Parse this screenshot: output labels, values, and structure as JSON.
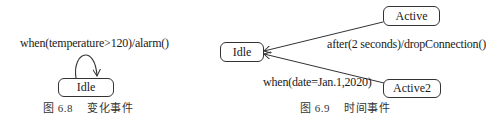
{
  "figure_left": {
    "transition_label": "when(temperature>120)/alarm()",
    "state": {
      "name": "Idle"
    },
    "caption": {
      "number": "图 6.8",
      "title": "变化事件"
    }
  },
  "figure_right": {
    "states": {
      "idle": "Idle",
      "active": "Active",
      "active2": "Active2"
    },
    "transitions": [
      {
        "from": "Active",
        "to": "Idle",
        "label": "after(2 seconds)/dropConnection()"
      },
      {
        "from": "Active2",
        "to": "Idle",
        "label": "when(date=Jan.1,2020)"
      }
    ],
    "caption": {
      "number": "图 6.9",
      "title": "时间事件"
    }
  },
  "colors": {
    "line": "#333333",
    "text": "#1a1a1a",
    "background": "#ffffff"
  }
}
